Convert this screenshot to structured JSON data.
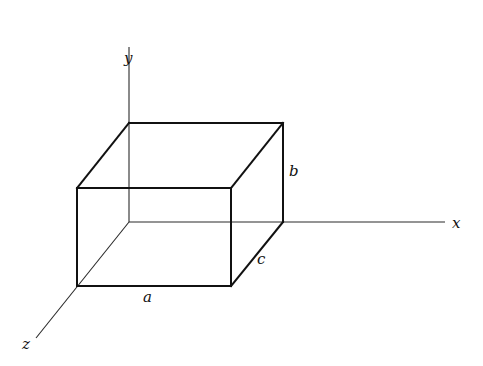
{
  "diagram": {
    "type": "3d-coordinate-box",
    "axes": {
      "x": {
        "label": "x",
        "from": [
          129,
          222
        ],
        "to": [
          445,
          222
        ]
      },
      "y": {
        "label": "y",
        "from": [
          129,
          222
        ],
        "to": [
          129,
          47
        ]
      },
      "z": {
        "label": "z",
        "from": [
          129,
          222
        ],
        "to": [
          36,
          338
        ]
      }
    },
    "box": {
      "dimensions": {
        "a": "a",
        "b": "b",
        "c": "c"
      },
      "vertices": {
        "back_top_left": [
          129,
          123
        ],
        "back_top_right": [
          283,
          123
        ],
        "back_bottom_right": [
          283,
          222
        ],
        "front_top_left": [
          77,
          188
        ],
        "front_top_right": [
          231,
          188
        ],
        "front_bottom_left": [
          77,
          286
        ],
        "front_bottom_right": [
          231,
          286
        ]
      }
    },
    "labels": {
      "x": "x",
      "y": "y",
      "z": "z",
      "a": "a",
      "b": "b",
      "c": "c"
    },
    "colors": {
      "background": "#ffffff",
      "ink": "#111111"
    }
  }
}
